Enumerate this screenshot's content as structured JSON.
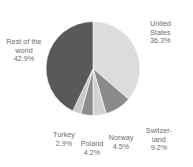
{
  "chart_data": {
    "type": "pie",
    "title": "",
    "subtitle": "",
    "xlabel": "",
    "ylabel": "",
    "legend": "none",
    "grid": false,
    "units": "percent",
    "start_angle_deg": 0,
    "direction": "clockwise",
    "categories": [
      "United States",
      "Switzerland",
      "Norway",
      "Poland",
      "Turkey",
      "Rest of the world"
    ],
    "values": [
      36.3,
      9.2,
      4.5,
      4.2,
      2.9,
      42.9
    ],
    "colors": [
      "#dcdcdc",
      "#8b8b8b",
      "#d2d2d2",
      "#8d8d8d",
      "#c9c9c9",
      "#595959"
    ],
    "slices": [
      {
        "name": "United States",
        "value": 36.3,
        "value_text": "36.3%",
        "color": "#dcdcdc",
        "label_lines": [
          "United",
          "States",
          "36.3%"
        ]
      },
      {
        "name": "Switzerland",
        "value": 9.2,
        "value_text": "9.2%",
        "color": "#8b8b8b",
        "label_lines": [
          "Switzer-",
          "land",
          "9.2%"
        ]
      },
      {
        "name": "Norway",
        "value": 4.5,
        "value_text": "4.5%",
        "color": "#d2d2d2",
        "label_lines": [
          "Norway",
          "4.5%",
          ""
        ]
      },
      {
        "name": "Poland",
        "value": 4.2,
        "value_text": "4.2%",
        "color": "#8d8d8d",
        "label_lines": [
          "Poland",
          "4.2%",
          ""
        ]
      },
      {
        "name": "Turkey",
        "value": 2.9,
        "value_text": "2.9%",
        "color": "#c9c9c9",
        "label_lines": [
          "Turkey",
          "2.9%",
          ""
        ]
      },
      {
        "name": "Rest of the world",
        "value": 42.9,
        "value_text": "42.9%",
        "color": "#595959",
        "label_lines": [
          "Rest of the",
          "world",
          "42.9%"
        ]
      }
    ],
    "geometry": {
      "center_x": 93,
      "center_y": 68.5,
      "radius": 47
    },
    "background": "#ffffff",
    "label_color": "#6b6b6b"
  }
}
